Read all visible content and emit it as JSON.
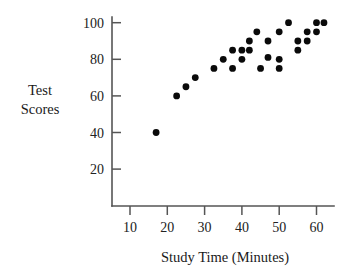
{
  "chart_data": {
    "type": "scatter",
    "title": "",
    "xlabel": "Study Time (Minutes)",
    "ylabel": "Test Scores",
    "ylabel_lines": [
      "Test",
      "Scores"
    ],
    "xlim": [
      0,
      65
    ],
    "ylim": [
      0,
      107
    ],
    "grid": false,
    "legend": "none",
    "marker": "filled-circle",
    "marker_color": "#0a0a0a",
    "axis_color": "#555555",
    "xticks": [
      10,
      20,
      30,
      40,
      50,
      60
    ],
    "xtick_labels": [
      "10",
      "20",
      "30",
      "40",
      "50",
      "60"
    ],
    "yticks": [
      20,
      40,
      60,
      80,
      100
    ],
    "ytick_labels": [
      "20",
      "40",
      "60",
      "80",
      "100"
    ],
    "points": [
      {
        "x": 17,
        "y": 40
      },
      {
        "x": 22.5,
        "y": 60
      },
      {
        "x": 25,
        "y": 65
      },
      {
        "x": 27.5,
        "y": 70
      },
      {
        "x": 32.5,
        "y": 75
      },
      {
        "x": 35,
        "y": 80
      },
      {
        "x": 37.5,
        "y": 75
      },
      {
        "x": 37.5,
        "y": 85
      },
      {
        "x": 40,
        "y": 80
      },
      {
        "x": 40,
        "y": 85
      },
      {
        "x": 42,
        "y": 85
      },
      {
        "x": 42,
        "y": 90
      },
      {
        "x": 44,
        "y": 95
      },
      {
        "x": 45,
        "y": 75
      },
      {
        "x": 47,
        "y": 81
      },
      {
        "x": 47,
        "y": 90
      },
      {
        "x": 50,
        "y": 75
      },
      {
        "x": 50,
        "y": 80
      },
      {
        "x": 50,
        "y": 95
      },
      {
        "x": 52.5,
        "y": 100
      },
      {
        "x": 55,
        "y": 85
      },
      {
        "x": 55,
        "y": 90
      },
      {
        "x": 57.5,
        "y": 90
      },
      {
        "x": 57.5,
        "y": 95
      },
      {
        "x": 60,
        "y": 95
      },
      {
        "x": 60,
        "y": 100
      },
      {
        "x": 62,
        "y": 100
      }
    ]
  }
}
